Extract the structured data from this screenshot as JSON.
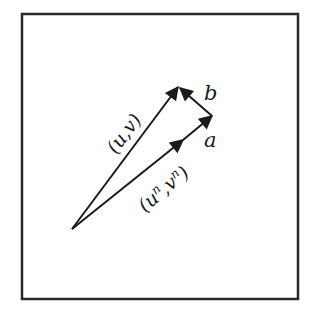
{
  "diagram": {
    "type": "vector-diagram",
    "frame": {
      "x": 22,
      "y": 14,
      "width": 276,
      "height": 285,
      "stroke": "#2a2a2a"
    },
    "origin": {
      "x": 72,
      "y": 229
    },
    "vectors": [
      {
        "id": "uv",
        "label": "(u,v)",
        "from": [
          72,
          229
        ],
        "to": [
          178,
          87
        ]
      },
      {
        "id": "unvn",
        "label": "(uⁿ,vⁿ)",
        "from": [
          72,
          229
        ],
        "to": [
          183,
          140
        ]
      },
      {
        "id": "a",
        "label": "a",
        "from": [
          183,
          140
        ],
        "to": [
          212,
          116
        ]
      },
      {
        "id": "b",
        "label": "b",
        "from": [
          212,
          116
        ],
        "to": [
          180,
          88
        ]
      }
    ],
    "labels": {
      "uv": "(u,v)",
      "unvn_open": "(u",
      "unvn_sup1": "n",
      "unvn_mid": ",v",
      "unvn_sup2": "n",
      "unvn_close": ")",
      "a": "a",
      "b": "b"
    },
    "colors": {
      "line": "#1a1a1a",
      "background": "#ffffff"
    }
  }
}
